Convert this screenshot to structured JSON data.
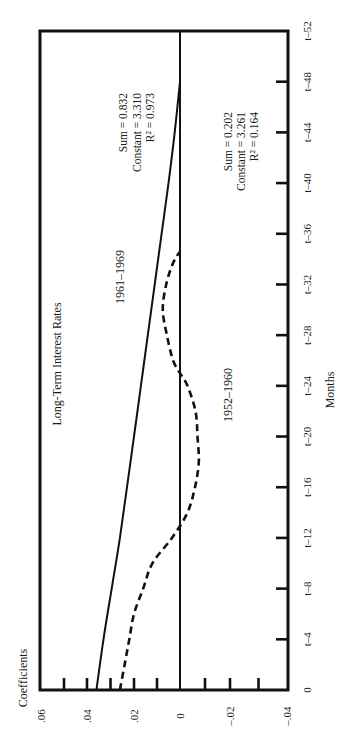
{
  "chart_data": {
    "type": "line",
    "title": "Long-Term Interest Rates",
    "xlabel": "Months",
    "ylabel": "Coefficients",
    "orientation": "rotated: months axis runs vertically on the right (0 at bottom, t–52 at top); coefficient axis runs horizontally at the bottom (.06 at left, –.04 at right)",
    "xlim": [
      0,
      52
    ],
    "ylim": [
      -0.04,
      0.06
    ],
    "grid": false,
    "legend": "none (series labelled inline)",
    "x_ticks": [
      "0",
      "t–4",
      "t–8",
      "t–12",
      "t–16",
      "t–20",
      "t–24",
      "t–28",
      "t–32",
      "t–36",
      "t–40",
      "t–44",
      "t–48",
      "t–52"
    ],
    "x_tick_values": [
      0,
      4,
      8,
      12,
      16,
      20,
      24,
      28,
      32,
      36,
      40,
      44,
      48,
      52
    ],
    "y_ticks": [
      ".06",
      ".04",
      ".02",
      "0",
      "–.02",
      "–.04"
    ],
    "y_tick_values": [
      0.06,
      0.04,
      0.02,
      0,
      -0.02,
      -0.04
    ],
    "y_minor_tick_values": [
      0.05,
      0.04,
      0.03,
      0.02,
      0.01,
      -0.01,
      -0.02,
      -0.03
    ],
    "series": [
      {
        "name": "1961–1969",
        "style": "solid",
        "x": [
          0,
          4,
          8,
          12,
          16,
          20,
          24,
          28,
          32,
          36,
          40,
          44,
          48
        ],
        "values": [
          0.036,
          0.033,
          0.0295,
          0.026,
          0.023,
          0.02,
          0.017,
          0.014,
          0.011,
          0.008,
          0.005,
          0.0023,
          0.0
        ],
        "stats": [
          "Sum = 0.832",
          "Constant = 3.310",
          "R² = 0.973"
        ]
      },
      {
        "name": "1952–1960",
        "style": "dashed",
        "x": [
          0,
          2,
          4,
          6,
          8,
          10,
          12,
          14,
          16,
          18,
          20,
          22,
          24,
          25,
          26,
          28,
          30,
          32,
          33.7,
          34.6
        ],
        "values": [
          0.026,
          0.024,
          0.022,
          0.02,
          0.016,
          0.012,
          0.0035,
          -0.003,
          -0.006,
          -0.0075,
          -0.007,
          -0.0062,
          -0.003,
          0.0,
          0.003,
          0.0057,
          0.0075,
          0.006,
          0.003,
          0.0
        ],
        "stats": [
          "Sum = 0.202",
          "Constant = 3.261",
          "R² = 0.164"
        ]
      }
    ]
  },
  "labels": {
    "title": "Long-Term Interest Rates",
    "xlabel": "Months",
    "ylabel": "Coefficients",
    "series_1961_1969": "1961–1969",
    "series_1952_1960": "1952–1960",
    "stats_1961_1969": {
      "sum": "Sum = 0.832",
      "constant": "Constant = 3.310",
      "r2": "R² = 0.973"
    },
    "stats_1952_1960": {
      "sum": "Sum = 0.202",
      "constant": "Constant = 3.261",
      "r2": "R² = 0.164"
    }
  }
}
